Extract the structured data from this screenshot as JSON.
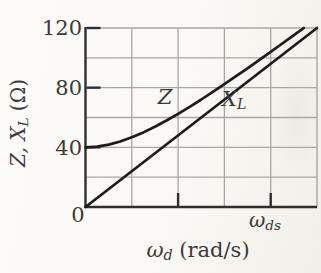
{
  "figure": {
    "y_axis": {
      "label_prefix": "Z, X",
      "label_sub": "L",
      "label_suffix": " (Ω)",
      "tick_120": "120",
      "tick_80": "80",
      "tick_40": "40",
      "origin": "0"
    },
    "x_axis": {
      "label_symbol": "ω",
      "label_sub": "d",
      "label_suffix": " (rad/s)",
      "tick_symbol": "ω",
      "tick_sub": "ds"
    },
    "curve_labels": {
      "z": "Z",
      "xl_main": "X",
      "xl_sub": "L"
    }
  },
  "colors": {
    "curve": "#1c1c1c",
    "axis": "#2e2e2e",
    "grid": "#a7a7a5",
    "text": "#3a3a3a",
    "paper": "#fbfaf7"
  },
  "chart_data": {
    "type": "line",
    "title": "",
    "xlabel": "ω_d (rad/s)",
    "ylabel": "Z, X_L (Ω)",
    "ylim": [
      0,
      120
    ],
    "ytick_values": [
      40,
      80,
      120
    ],
    "ytick_labels": [
      "40",
      "80",
      "120"
    ],
    "origin_label": "0",
    "ygrid_values": [
      20,
      40,
      60,
      80,
      100
    ],
    "xgrid_fractions": [
      0.2,
      0.4,
      0.6,
      0.8
    ],
    "xtick_fractions": [
      0.4,
      0.8
    ],
    "xtick_label_at_0.8": "ω_ds",
    "x_axis_note": "x axis has no numeric scale; ω_ds marked at 0.8 of full width",
    "grid": true,
    "legend_position": "inline curve labels",
    "series": [
      {
        "name": "XL",
        "label": "X_L",
        "description": "inductive reactance, straight line through origin",
        "x_fractions": [
          0,
          1
        ],
        "values": [
          0,
          120
        ]
      },
      {
        "name": "Z",
        "label": "Z",
        "description": "impedance Z = sqrt(R^2 + X_L^2) with R = 40 Ω, asymptotic to X_L",
        "x_fractions": [
          0,
          0.05,
          0.1,
          0.15,
          0.2,
          0.25,
          0.3,
          0.35,
          0.4,
          0.45,
          0.5,
          0.55,
          0.6,
          0.65,
          0.7,
          0.75,
          0.8,
          0.85,
          0.9,
          0.943
        ],
        "values": [
          40,
          40.4,
          41.8,
          43.9,
          46.7,
          50,
          53.8,
          58,
          62.5,
          67.2,
          72.1,
          77.2,
          82.4,
          87.7,
          93,
          98.5,
          104,
          109.6,
          115.2,
          120
        ]
      }
    ]
  }
}
